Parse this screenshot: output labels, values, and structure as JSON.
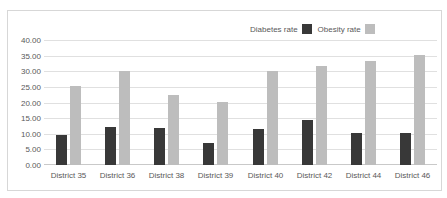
{
  "chart_data": {
    "type": "bar",
    "title": "",
    "categories": [
      "District 35",
      "District 36",
      "District 38",
      "District 39",
      "District 40",
      "District 42",
      "District 44",
      "District 46"
    ],
    "series": [
      {
        "name": "Diabetes rate",
        "color": "#383838",
        "values": [
          9.5,
          12.0,
          11.7,
          6.9,
          11.6,
          14.5,
          10.2,
          10.1
        ]
      },
      {
        "name": "Obesity rate",
        "color": "#bdbdbd",
        "values": [
          25.3,
          30.2,
          22.3,
          20.1,
          30.0,
          31.8,
          33.2,
          35.2
        ]
      }
    ],
    "ylim": [
      0,
      40
    ],
    "ytick_step": 5,
    "ytick_labels": [
      "0.00",
      "5.00",
      "10.00",
      "15.00",
      "20.00",
      "25.00",
      "30.00",
      "35.00",
      "40.00"
    ],
    "grid": true,
    "legend_position": "top-right",
    "colors": {
      "gridline": "#e0e0e0",
      "baseline": "#c9c9c9",
      "frame_border": "#d7d7d7",
      "text": "#595959",
      "background": "#ffffff"
    }
  }
}
